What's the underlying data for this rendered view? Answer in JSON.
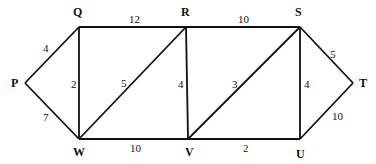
{
  "diagram": {
    "type": "weighted-undirected-graph",
    "nodes": [
      {
        "id": "P",
        "x": 25,
        "y": 83,
        "lx": 11,
        "ly": 87
      },
      {
        "id": "Q",
        "x": 79,
        "y": 27,
        "lx": 73,
        "ly": 16
      },
      {
        "id": "R",
        "x": 186,
        "y": 27,
        "lx": 181,
        "ly": 16
      },
      {
        "id": "S",
        "x": 300,
        "y": 27,
        "lx": 295,
        "ly": 16
      },
      {
        "id": "T",
        "x": 353,
        "y": 83,
        "lx": 359,
        "ly": 87
      },
      {
        "id": "W",
        "x": 79,
        "y": 139,
        "lx": 73,
        "ly": 156
      },
      {
        "id": "V",
        "x": 188,
        "y": 139,
        "lx": 185,
        "ly": 156
      },
      {
        "id": "U",
        "x": 300,
        "y": 139,
        "lx": 296,
        "ly": 158
      }
    ],
    "edges": [
      {
        "from": "P",
        "to": "Q",
        "weight": "4",
        "lx": 43,
        "ly": 52
      },
      {
        "from": "P",
        "to": "W",
        "weight": "7",
        "lx": 43,
        "ly": 121
      },
      {
        "from": "Q",
        "to": "R",
        "weight": "12",
        "lx": 129,
        "ly": 23
      },
      {
        "from": "Q",
        "to": "W",
        "weight": "2",
        "lx": 71,
        "ly": 88
      },
      {
        "from": "W",
        "to": "R",
        "weight": "5",
        "lx": 121,
        "ly": 87
      },
      {
        "from": "R",
        "to": "V",
        "weight": "4",
        "lx": 178,
        "ly": 88
      },
      {
        "from": "W",
        "to": "V",
        "weight": "10",
        "lx": 130,
        "ly": 152
      },
      {
        "from": "R",
        "to": "S",
        "weight": "10",
        "lx": 238,
        "ly": 23
      },
      {
        "from": "V",
        "to": "S",
        "weight": "3",
        "lx": 232,
        "ly": 88
      },
      {
        "from": "S",
        "to": "U",
        "weight": "4",
        "lx": 304,
        "ly": 88
      },
      {
        "from": "V",
        "to": "U",
        "weight": "2",
        "lx": 243,
        "ly": 152
      },
      {
        "from": "S",
        "to": "T",
        "weight": "5",
        "lx": 330,
        "ly": 58
      },
      {
        "from": "U",
        "to": "T",
        "weight": "10",
        "lx": 332,
        "ly": 120
      }
    ]
  }
}
